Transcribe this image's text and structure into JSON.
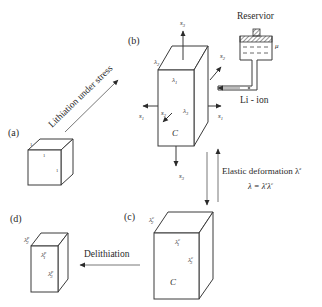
{
  "diagram": {
    "panels": {
      "a": {
        "label": "(a)",
        "edges": {
          "depth": "1",
          "width": "1",
          "height": "1"
        }
      },
      "b": {
        "label": "(b)",
        "lambda_depth": "λ",
        "lambda_depth_sub": "2",
        "lambda_width": "λ",
        "lambda_width_sub": "1",
        "lambda_height": "λ",
        "lambda_height_sub": "3",
        "center": "C",
        "stress": {
          "top": "s",
          "top_sub": "3",
          "bottom": "s",
          "bottom_sub": "3",
          "left": "s",
          "left_sub": "1",
          "right": "s",
          "right_sub": "1",
          "back": "s",
          "back_sub": "2",
          "front": "s",
          "front_sub": "2"
        }
      },
      "c": {
        "label": "(c)",
        "lambda_depth": "λ",
        "lambda_depth_sup": "c",
        "lambda_depth_sub": "2",
        "lambda_width": "λ",
        "lambda_width_sup": "c",
        "lambda_width_sub": "1",
        "lambda_height": "λ",
        "lambda_height_sup": "c",
        "lambda_height_sub": "3",
        "center": "C"
      },
      "d": {
        "label": "(d)",
        "lambda_depth": "λ",
        "lambda_depth_sup": "p",
        "lambda_depth_sub": "2",
        "lambda_width": "λ",
        "lambda_width_sup": "p",
        "lambda_width_sub": "1",
        "lambda_height": "λ",
        "lambda_height_sup": "p",
        "lambda_height_sub": "3"
      }
    },
    "reservoir": {
      "title": "Reservior",
      "potential": "μ",
      "ion": "Li - ion"
    },
    "transitions": {
      "a_to_b": "Lithiation under stress",
      "elastic": "Elastic deformation λ",
      "elastic_sup": "e",
      "equation": "λ = λ",
      "equation_sup1": "e",
      "equation_tail": "λ",
      "equation_sup2": "c",
      "c_to_d": "Delithiation"
    },
    "colors": {
      "stroke": "#3a3a3a",
      "text": "#2a2a2a",
      "background": "#ffffff"
    }
  }
}
